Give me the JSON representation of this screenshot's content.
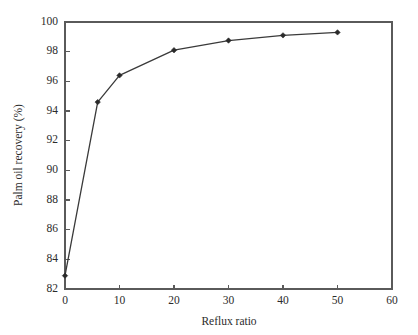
{
  "chart_data": {
    "type": "line",
    "title": "",
    "xlabel": "Reflux ratio",
    "ylabel": "Palm oil recovery (%)",
    "xlim": [
      0,
      60
    ],
    "ylim": [
      82,
      100
    ],
    "xticks": [
      0,
      10,
      20,
      30,
      40,
      50,
      60
    ],
    "yticks": [
      82,
      84,
      86,
      88,
      90,
      92,
      94,
      96,
      98,
      100
    ],
    "xtick_labels": [
      "0",
      "10",
      "20",
      "30",
      "40",
      "50",
      "60"
    ],
    "ytick_labels": [
      "82",
      "84",
      "86",
      "88",
      "90",
      "92",
      "94",
      "96",
      "98",
      "100"
    ],
    "grid": false,
    "legend": null,
    "legend_position": "none",
    "series": [
      {
        "name": "Palm oil recovery",
        "marker": "diamond",
        "color": "#2a2a2a",
        "x": [
          0,
          6,
          10,
          20,
          30,
          40,
          50
        ],
        "values": [
          82.9,
          94.6,
          96.4,
          98.1,
          98.75,
          99.1,
          99.3
        ]
      }
    ]
  },
  "figure": {
    "axis_color": "#5a5a5a",
    "line_color": "#3a3a3a",
    "marker_color": "#2a2a2a",
    "background": "#ffffff"
  }
}
